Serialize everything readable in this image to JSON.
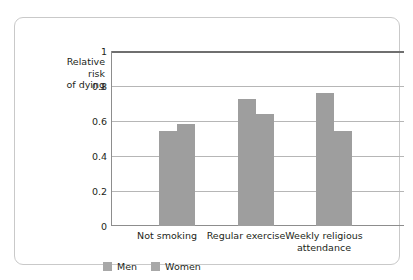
{
  "chart_data": {
    "type": "bar",
    "title": "",
    "xlabel": "",
    "ylabel": "Relative risk of dying",
    "ylabel_lines": [
      "Relative",
      "risk",
      "of dying"
    ],
    "categories": [
      "Not smoking",
      "Regular exercise",
      "Weekly religious attendance"
    ],
    "category_label_lines": [
      [
        "Not smoking"
      ],
      [
        "Regular exercise"
      ],
      [
        "Weekly religious",
        "attendance"
      ]
    ],
    "series": [
      {
        "name": "Men",
        "values": [
          0.545,
          0.73,
          0.765
        ]
      },
      {
        "name": "Women",
        "values": [
          0.585,
          0.645,
          0.545
        ]
      }
    ],
    "ylim": [
      0,
      1
    ],
    "yticks": [
      0,
      0.2,
      0.4,
      0.6,
      0.8,
      1
    ],
    "ytick_labels": [
      "0",
      "0.2",
      "0.4",
      "0.6",
      "0.8",
      "1"
    ],
    "grid": true,
    "legend_position": "bottom-left",
    "colors": {
      "bar_fill": "#9e9e9e",
      "gridline": "#b6b6b6",
      "axis": "#8d8d8d",
      "top_rule": "#6f6f6f",
      "frame": "#c9c9c9",
      "background": "#ffffff",
      "text": "#231f20",
      "legend_swatch": "#a8a8a8"
    }
  },
  "legend": {
    "items": [
      {
        "label": "Men"
      },
      {
        "label": "Women"
      }
    ]
  }
}
